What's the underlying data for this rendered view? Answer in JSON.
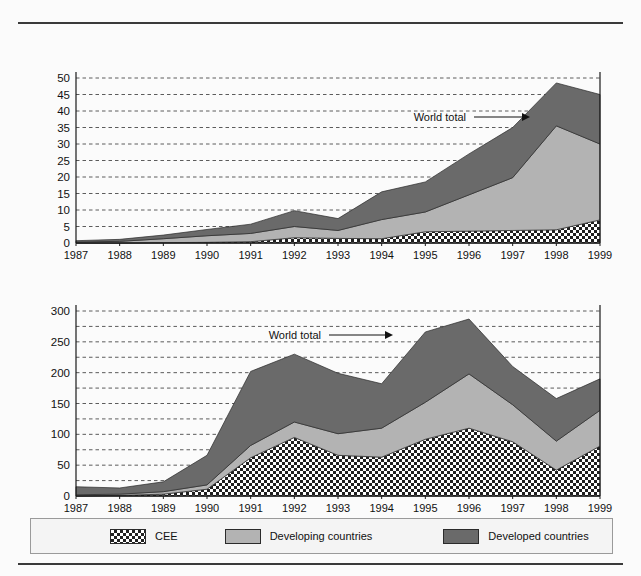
{
  "document": {
    "top_rule": true,
    "bottom_rule": true
  },
  "panels": [
    {
      "id": "a",
      "title": "(a) Transaction values (billion dollars)",
      "unit_label": "$ billion",
      "annotation": "World total"
    },
    {
      "id": "b",
      "title": "(b) Number of deals",
      "unit_label": "",
      "annotation": "World total"
    }
  ],
  "legend": {
    "items": [
      {
        "key": "cee",
        "label": "CEE",
        "pattern": "checkerboard",
        "color": "#222222"
      },
      {
        "key": "developing",
        "label": "Developing countries",
        "pattern": "solid",
        "color": "#b3b3b3"
      },
      {
        "key": "developed",
        "label": "Developed countries",
        "pattern": "solid",
        "color": "#6a6a6a"
      }
    ]
  },
  "chart_data": [
    {
      "type": "area",
      "stacked": true,
      "id": "a",
      "title": "(a) Transaction values (billion dollars)",
      "xlabel": "",
      "ylabel": "$ billion",
      "ylim": [
        0,
        50
      ],
      "yticks": [
        0,
        5,
        10,
        15,
        20,
        25,
        30,
        35,
        40,
        45,
        50
      ],
      "grid": true,
      "legend_position": "bottom",
      "annotations": [
        {
          "text": "World total",
          "points_to": "top of stack",
          "x": 1998,
          "y": 44
        }
      ],
      "categories": [
        1987,
        1988,
        1989,
        1990,
        1991,
        1992,
        1993,
        1994,
        1995,
        1996,
        1997,
        1998,
        1999
      ],
      "series": [
        {
          "name": "CEE",
          "values": [
            0.0,
            0.0,
            0.1,
            0.2,
            0.4,
            1.6,
            1.4,
            1.3,
            3.4,
            3.6,
            3.8,
            4.0,
            7.0
          ]
        },
        {
          "name": "Developing countries",
          "values": [
            0.3,
            0.5,
            1.2,
            2.0,
            2.5,
            3.4,
            2.4,
            5.8,
            6.0,
            11.0,
            16.0,
            31.5,
            23.0
          ]
        },
        {
          "name": "Developed countries",
          "values": [
            0.4,
            0.6,
            1.1,
            1.9,
            2.8,
            4.8,
            3.6,
            8.4,
            9.1,
            12.4,
            15.2,
            13.0,
            15.0
          ]
        }
      ],
      "world_total": [
        0.7,
        1.1,
        2.4,
        4.1,
        5.7,
        9.8,
        7.4,
        15.5,
        18.5,
        27.0,
        35.0,
        48.5,
        45.0
      ]
    },
    {
      "type": "area",
      "stacked": true,
      "id": "b",
      "title": "(b) Number of deals",
      "xlabel": "",
      "ylabel": "",
      "ylim": [
        0,
        300
      ],
      "yticks": [
        0,
        50,
        100,
        150,
        200,
        250,
        300
      ],
      "minor_yticks": [
        25,
        75,
        125,
        175,
        225,
        275
      ],
      "grid": true,
      "legend_position": "bottom",
      "annotations": [
        {
          "text": "World total",
          "points_to": "top of stack",
          "x": 1995,
          "y": 255
        }
      ],
      "categories": [
        1987,
        1988,
        1989,
        1990,
        1991,
        1992,
        1993,
        1994,
        1995,
        1996,
        1997,
        1998,
        1999
      ],
      "series": [
        {
          "name": "CEE",
          "values": [
            0,
            1,
            3,
            11,
            62,
            95,
            66,
            63,
            92,
            110,
            88,
            42,
            81
          ]
        },
        {
          "name": "Developing countries",
          "values": [
            2,
            2,
            4,
            7,
            20,
            25,
            35,
            47,
            60,
            88,
            60,
            47,
            58
          ]
        },
        {
          "name": "Developed countries",
          "values": [
            13,
            10,
            16,
            48,
            120,
            110,
            98,
            72,
            114,
            89,
            62,
            69,
            51
          ]
        }
      ],
      "world_total": [
        15,
        13,
        23,
        66,
        202,
        230,
        199,
        182,
        266,
        287,
        210,
        158,
        190
      ]
    }
  ]
}
